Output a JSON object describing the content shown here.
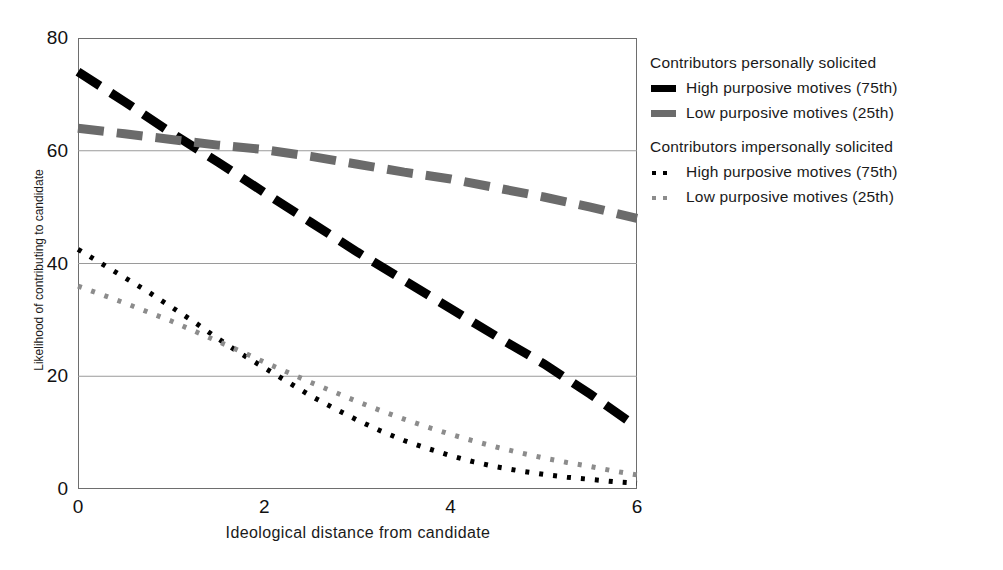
{
  "chart_data": {
    "type": "line",
    "title": "",
    "xlabel": "Ideological distance from candidate",
    "ylabel": "Likelihood of contributing to candidate",
    "xlim": [
      0,
      6
    ],
    "ylim": [
      0,
      80
    ],
    "xticks": [
      "0",
      "2",
      "4",
      "6"
    ],
    "xtick_values": [
      0,
      2,
      4,
      6
    ],
    "yticks": [
      "0",
      "20",
      "40",
      "60",
      "80"
    ],
    "ytick_values": [
      0,
      20,
      40,
      60,
      80
    ],
    "grid": "horizontal",
    "legend_position": "right",
    "colors": {
      "high_personal": "#000000",
      "low_personal": "#6b6b6b",
      "high_impersonal": "#000000",
      "low_impersonal": "#8c8c8c",
      "axis": "#6e6e6e",
      "gridline": "#9a9a9a"
    },
    "series": [
      {
        "name": "High purposive motives (75th)",
        "group": "Contributors personally solicited",
        "style": "thick-dashed",
        "color": "#000000",
        "x": [
          0,
          0.5,
          1,
          1.5,
          2,
          2.5,
          3,
          3.5,
          4,
          4.5,
          5,
          5.5,
          6
        ],
        "values": [
          74.0,
          68.7,
          63.2,
          58.0,
          52.6,
          47.3,
          42.0,
          37.0,
          32.0,
          27.0,
          22.2,
          16.8,
          11.0
        ]
      },
      {
        "name": "Low purposive motives (25th)",
        "group": "Contributors personally solicited",
        "style": "thick-dashed",
        "color": "#6b6b6b",
        "x": [
          0,
          0.5,
          1,
          1.5,
          2,
          2.5,
          3,
          3.5,
          4,
          4.5,
          5,
          5.5,
          6
        ],
        "values": [
          64.0,
          63.0,
          62.0,
          61.0,
          60.2,
          59.0,
          57.6,
          56.2,
          55.0,
          53.4,
          51.8,
          50.0,
          48.0
        ]
      },
      {
        "name": "High purposive motives (75th)",
        "group": "Contributors impersonally solicited",
        "style": "dotted",
        "color": "#000000",
        "x": [
          0,
          0.25,
          0.5,
          0.75,
          1,
          1.25,
          1.5,
          1.75,
          2,
          2.25,
          2.5,
          2.75,
          3,
          3.25,
          3.5,
          3.75,
          4,
          4.25,
          4.5,
          4.75,
          5,
          5.25,
          5.5,
          5.75,
          6
        ],
        "values": [
          42.5,
          40.0,
          37.5,
          35.0,
          32.3,
          29.6,
          26.7,
          24.0,
          21.5,
          19.0,
          16.5,
          14.3,
          12.2,
          10.3,
          8.6,
          7.2,
          5.9,
          4.8,
          3.9,
          3.2,
          2.6,
          2.1,
          1.7,
          1.3,
          1.0
        ]
      },
      {
        "name": "Low purposive motives (25th)",
        "group": "Contributors impersonally solicited",
        "style": "dotted",
        "color": "#8c8c8c",
        "x": [
          0,
          0.25,
          0.5,
          0.75,
          1,
          1.25,
          1.5,
          1.75,
          2,
          2.25,
          2.5,
          2.75,
          3,
          3.25,
          3.5,
          3.75,
          4,
          4.25,
          4.5,
          4.75,
          5,
          5.25,
          5.5,
          5.75,
          6
        ],
        "values": [
          36.0,
          34.5,
          33.0,
          31.4,
          29.8,
          28.0,
          26.2,
          24.4,
          22.5,
          20.7,
          18.9,
          17.2,
          15.5,
          13.9,
          12.4,
          11.0,
          9.7,
          8.5,
          7.4,
          6.4,
          5.5,
          4.7,
          4.0,
          3.2,
          2.5
        ]
      }
    ]
  },
  "legend": {
    "groups": [
      {
        "header": "Contributors personally solicited",
        "entries": [
          {
            "label": "High purposive motives (75th)",
            "marker": "thick-bar",
            "color": "#000000"
          },
          {
            "label": "Low purposive motives (25th)",
            "marker": "thick-bar",
            "color": "#6b6b6b"
          }
        ]
      },
      {
        "header": "Contributors impersonally solicited",
        "entries": [
          {
            "label": "High purposive motives (75th)",
            "marker": "dots",
            "color": "#000000"
          },
          {
            "label": "Low purposive motives (25th)",
            "marker": "dots",
            "color": "#8c8c8c"
          }
        ]
      }
    ]
  }
}
